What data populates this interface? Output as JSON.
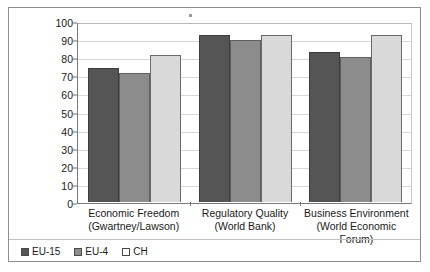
{
  "chart_data": {
    "type": "bar",
    "title": "",
    "subtitle": "",
    "xlabel": "",
    "ylabel": "",
    "ylim": [
      0,
      100
    ],
    "yticks": [
      0,
      10,
      20,
      30,
      40,
      50,
      60,
      70,
      80,
      90,
      100
    ],
    "grid": true,
    "legend_position": "bottom-left",
    "categories": [
      "Economic Freedom\n(Gwartney/Lawson)",
      "Regulatory Quality\n(World Bank)",
      "Business Environment\n(World Economic Forum)"
    ],
    "category_lines": [
      [
        "Economic Freedom",
        "(Gwartney/Lawson)"
      ],
      [
        "Regulatory Quality",
        "(World Bank)"
      ],
      [
        "Business Environment",
        "(World Economic Forum)"
      ]
    ],
    "series": [
      {
        "name": "EU-15",
        "color": "#555555",
        "values": [
          74,
          92,
          83
        ]
      },
      {
        "name": "EU-4",
        "color": "#8c8c8c",
        "values": [
          71.5,
          89.5,
          80
        ]
      },
      {
        "name": "CH",
        "color": "#d9d9d9",
        "values": [
          81.5,
          92.5,
          92.5
        ]
      }
    ]
  },
  "legend": {
    "items": [
      {
        "label": "EU-15",
        "swatch": "legend-swatch-eu15"
      },
      {
        "label": "EU-4",
        "swatch": "legend-swatch-eu4"
      },
      {
        "label": "CH",
        "swatch": "legend-swatch-ch"
      }
    ]
  },
  "axis": {
    "y_tick_labels": [
      "100",
      "90",
      "80",
      "70",
      "60",
      "50",
      "40",
      "30",
      "20",
      "10",
      "0"
    ]
  }
}
